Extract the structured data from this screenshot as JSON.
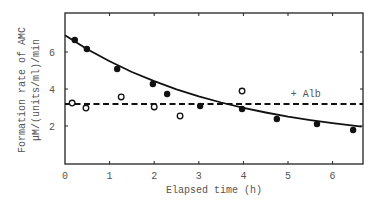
{
  "chart_data": {
    "type": "scatter",
    "title": "",
    "xlabel": "Elapsed time (h)",
    "ylabel_line1": "Formation rate of AMC",
    "ylabel_line2": "μM/(units/ml)/min",
    "xlim": [
      0,
      6.65
    ],
    "ylim": [
      0,
      7.6
    ],
    "x_ticks": [
      0,
      1,
      2,
      3,
      4,
      5,
      6
    ],
    "x_tick_labels": [
      "0",
      "1",
      "2",
      "3",
      "4",
      "5",
      "6"
    ],
    "y_ticks": [
      2,
      4,
      6
    ],
    "y_tick_labels": [
      "2",
      "4",
      "6"
    ],
    "grid": false,
    "legend": null,
    "annotations": [
      {
        "text": "+ Alb",
        "x": 5.4,
        "y": 3.55
      }
    ],
    "series": [
      {
        "name": "control (filled circles)",
        "marker": "filled-circle",
        "x": [
          0.22,
          0.49,
          1.17,
          1.97,
          2.29,
          3.03,
          3.97,
          4.75,
          5.65,
          6.46
        ],
        "y": [
          6.65,
          6.16,
          5.08,
          4.27,
          3.73,
          3.08,
          2.92,
          2.38,
          2.11,
          1.78
        ]
      },
      {
        "name": "+ Alb (open circles)",
        "marker": "open-circle",
        "x": [
          0.16,
          0.47,
          1.26,
          2.0,
          2.58,
          3.97
        ],
        "y": [
          3.24,
          2.97,
          3.57,
          3.03,
          2.54,
          3.89
        ]
      },
      {
        "name": "control fit",
        "style": "solid-line",
        "x": [
          0,
          0.5,
          1,
          1.5,
          2,
          2.5,
          3,
          3.5,
          4,
          4.5,
          5,
          5.5,
          6,
          6.65
        ],
        "y": [
          6.9,
          6.15,
          5.5,
          4.92,
          4.42,
          3.98,
          3.6,
          3.27,
          2.98,
          2.73,
          2.51,
          2.32,
          2.15,
          1.96
        ]
      },
      {
        "name": "+ Alb mean",
        "style": "dashed-line",
        "x": [
          0,
          6.65
        ],
        "y": [
          3.19,
          3.19
        ]
      }
    ]
  }
}
